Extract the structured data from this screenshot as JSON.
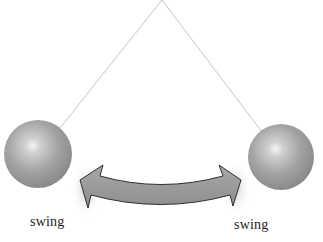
{
  "diagram": {
    "title": "",
    "pendulum": {
      "pivot": {
        "x": 162,
        "y": 0
      },
      "string_color": "#bdbdbd",
      "left_bob": {
        "cx": 38,
        "cy": 154,
        "r": 34
      },
      "right_bob": {
        "cx": 281,
        "cy": 157,
        "r": 33
      },
      "bob_colors": {
        "highlight": "#f2f2f2",
        "mid": "#a6a6a6",
        "shadow": "#7a7a7a"
      }
    },
    "arrow": {
      "type": "double-headed-curved-arrow",
      "fill": "#9a9a9a",
      "stroke": "#333333"
    },
    "labels": {
      "left": "swing",
      "right": "swing"
    }
  }
}
